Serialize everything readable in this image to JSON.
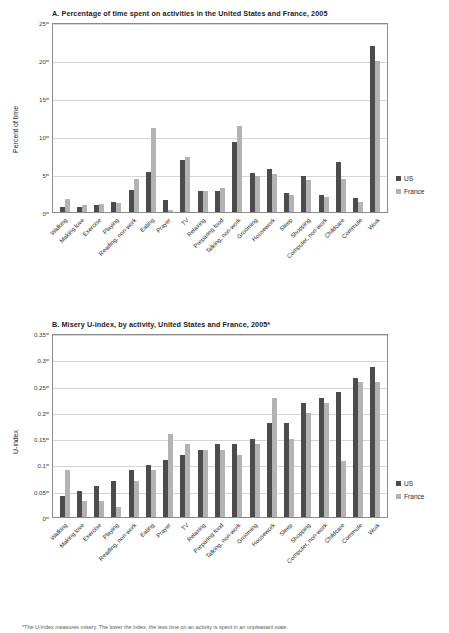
{
  "figures": [
    {
      "id": "a",
      "title": "A.   Percentage of time spent on activities in the United States and France, 2005"
    },
    {
      "id": "b",
      "title": "B.   Misery U-index, by activity, United States and France, 2005*"
    }
  ],
  "legend": {
    "us": "US",
    "france": "France"
  },
  "colors": {
    "us": "#4c4c4c",
    "france": "#b3b3b3",
    "grid": "#d4d4d4",
    "axis": "#8c8c8c"
  },
  "footnote": "*The U-Index measures misery. The lower the index, the less time on an activity is spent in an unpleasant state.",
  "chart_data": [
    {
      "type": "bar",
      "title": "A.   Percentage of time spent on activities in the United States and France, 2005",
      "xlabel": "",
      "ylabel": "Percent of time",
      "ylim": [
        0,
        25
      ],
      "yticks": [
        0,
        5,
        10,
        15,
        20,
        25
      ],
      "ytick_labels": [
        "0",
        "5",
        "10",
        "15",
        "20",
        "25"
      ],
      "grid": true,
      "legend_position": "right",
      "categories": [
        "Walking",
        "Making love",
        "Exercise",
        "Playing",
        "Reading, non-work",
        "Eating",
        "Prayer",
        "TV",
        "Relaxing",
        "Preparing food",
        "Talking, non-work",
        "Grooming",
        "Housework",
        "Sleep",
        "Shopping",
        "Computer, non-work",
        "Childcare",
        "Commute",
        "Work"
      ],
      "series": [
        {
          "name": "US",
          "color": "#4c4c4c",
          "values": [
            0.6,
            0.7,
            0.9,
            1.3,
            2.9,
            5.2,
            1.6,
            6.9,
            2.8,
            2.8,
            9.2,
            5.1,
            5.7,
            2.5,
            4.7,
            2.3,
            6.6,
            1.9,
            21.8
          ]
        },
        {
          "name": "France",
          "color": "#b3b3b3",
          "values": [
            1.7,
            0.9,
            1.1,
            1.2,
            4.3,
            11.0,
            0.2,
            7.2,
            2.7,
            3.2,
            11.3,
            4.7,
            5.0,
            2.2,
            4.2,
            2.0,
            4.3,
            1.3,
            19.9
          ]
        }
      ]
    },
    {
      "type": "bar",
      "title": "B.   Misery U-index, by activity, United States and France, 2005*",
      "xlabel": "",
      "ylabel": "U-index",
      "ylim": [
        0,
        0.35
      ],
      "yticks": [
        0,
        0.05,
        0.1,
        0.15,
        0.2,
        0.25,
        0.3,
        0.35
      ],
      "ytick_labels": [
        "0",
        "0.05",
        "0.1",
        "0.15",
        "0.2",
        "0.25",
        "0.3",
        "0.35"
      ],
      "grid": true,
      "legend_position": "right",
      "categories": [
        "Walking",
        "Making love",
        "Exercise",
        "Playing",
        "Reading, non-work",
        "Eating",
        "Prayer",
        "TV",
        "Relaxing",
        "Preparing food",
        "Talking, non-work",
        "Grooming",
        "Housework",
        "Sleep",
        "Shopping",
        "Computer, non-work",
        "Childcare",
        "Commute",
        "Work"
      ],
      "series": [
        {
          "name": "US",
          "color": "#4c4c4c",
          "values": [
            0.04,
            0.049,
            0.059,
            0.069,
            0.089,
            0.098,
            0.108,
            0.118,
            0.128,
            0.138,
            0.138,
            0.148,
            0.178,
            0.178,
            0.217,
            0.227,
            0.237,
            0.265,
            0.286
          ]
        },
        {
          "name": "France",
          "color": "#b3b3b3",
          "values": [
            0.089,
            0.03,
            0.03,
            0.02,
            0.069,
            0.089,
            0.158,
            0.138,
            0.128,
            0.128,
            0.118,
            0.138,
            0.227,
            0.148,
            0.197,
            0.217,
            0.106,
            0.256,
            0.256
          ]
        }
      ]
    }
  ]
}
